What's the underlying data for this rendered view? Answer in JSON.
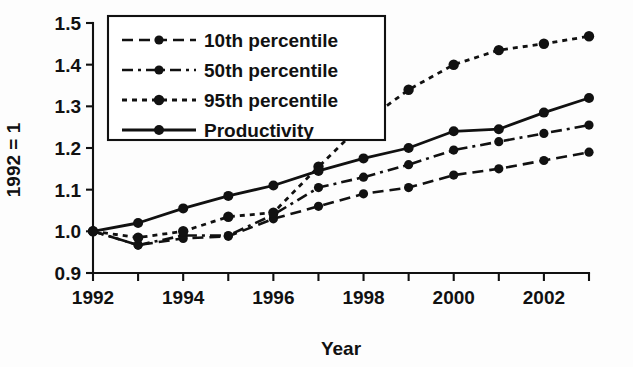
{
  "chart_data": {
    "type": "line",
    "title": "",
    "xlabel": "Year",
    "ylabel": "1992 = 1",
    "x": [
      1992,
      1993,
      1994,
      1995,
      1996,
      1997,
      1998,
      1999,
      2000,
      2001,
      2002,
      2003
    ],
    "xtick_labels": [
      "1992",
      "1994",
      "1996",
      "1998",
      "2000",
      "2002"
    ],
    "xticks": [
      1992,
      1994,
      1996,
      1998,
      2000,
      2002
    ],
    "ytick_labels": [
      "0.9",
      "1.0",
      "1.1",
      "1.2",
      "1.3",
      "1.4",
      "1.5"
    ],
    "yticks": [
      0.9,
      1.0,
      1.1,
      1.2,
      1.3,
      1.4,
      1.5
    ],
    "xlim": [
      1992,
      2003
    ],
    "ylim": [
      0.9,
      1.5
    ],
    "grid": false,
    "legend_position": "upper left",
    "series": [
      {
        "name": "10th percentile",
        "style": "dashed",
        "dasharray": "11,6",
        "width": 2.6,
        "marker": "circle",
        "marker_size": 4.6,
        "values": [
          1.0,
          0.967,
          0.983,
          0.988,
          1.03,
          1.06,
          1.09,
          1.105,
          1.135,
          1.15,
          1.17,
          1.19
        ]
      },
      {
        "name": "50th percentile",
        "style": "dash-dot",
        "dasharray": "11,5,3,5",
        "width": 2.6,
        "marker": "circle",
        "marker_size": 4.6,
        "values": [
          1.0,
          0.967,
          0.99,
          0.99,
          1.04,
          1.105,
          1.13,
          1.16,
          1.195,
          1.215,
          1.235,
          1.255
        ]
      },
      {
        "name": "95th percentile",
        "style": "dotted",
        "dasharray": "5,5",
        "width": 2.8,
        "marker": "circle",
        "marker_size": 5.2,
        "values": [
          1.0,
          0.985,
          1.0,
          1.035,
          1.045,
          1.155,
          1.26,
          1.34,
          1.4,
          1.435,
          1.45,
          1.468
        ]
      },
      {
        "name": "Productivity",
        "style": "solid",
        "dasharray": "",
        "width": 2.8,
        "marker": "circle",
        "marker_size": 5.0,
        "values": [
          1.0,
          1.02,
          1.055,
          1.085,
          1.11,
          1.145,
          1.175,
          1.2,
          1.24,
          1.245,
          1.285,
          1.32
        ]
      }
    ],
    "legend_entries": [
      {
        "label": "10th percentile",
        "style": "dashed"
      },
      {
        "label": "50th percentile",
        "style": "dash-dot"
      },
      {
        "label": "95th percentile",
        "style": "dotted"
      },
      {
        "label": "Productivity",
        "style": "solid"
      }
    ],
    "colors": {
      "ink": "#111111",
      "background": "#ffffff"
    }
  }
}
